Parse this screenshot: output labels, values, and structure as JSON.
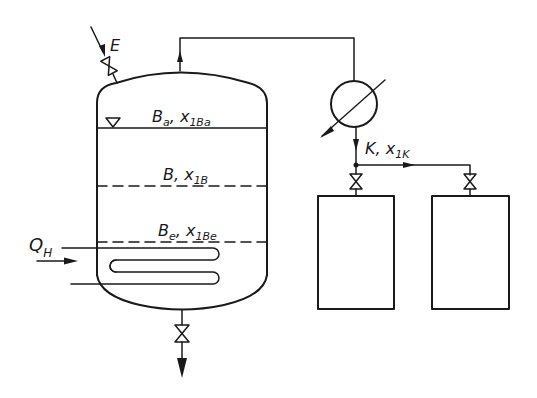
{
  "diagram": {
    "type": "process-flow-diagram",
    "colors": {
      "line": "#1a1a1a",
      "background": "#ffffff"
    },
    "labels": {
      "feed": "E",
      "heat_input": "Q",
      "heat_input_sub": "H",
      "level_top": "B",
      "level_top_sub": "a",
      "level_top_x": "x",
      "level_top_x_sub": "1Ba",
      "level_mid": "B",
      "level_mid_x": "x",
      "level_mid_x_sub": "1B",
      "level_bottom": "B",
      "level_bottom_sub": "e",
      "level_bottom_x": "x",
      "level_bottom_x_sub": "1Be",
      "distillate": "K",
      "distillate_x": "x",
      "distillate_x_sub": "1K"
    },
    "components": [
      {
        "id": "still-vessel",
        "label": "Still (vessel)"
      },
      {
        "id": "heating-coil",
        "label": "Heating coil"
      },
      {
        "id": "feed-valve",
        "label": "Feed valve E"
      },
      {
        "id": "bottom-valve",
        "label": "Bottom drain valve"
      },
      {
        "id": "condenser",
        "label": "Condenser"
      },
      {
        "id": "receiver-1",
        "label": "Receiver 1"
      },
      {
        "id": "receiver-2",
        "label": "Receiver 2"
      },
      {
        "id": "receiver-1-valve",
        "label": "Receiver 1 valve"
      },
      {
        "id": "receiver-2-valve",
        "label": "Receiver 2 valve"
      }
    ]
  }
}
